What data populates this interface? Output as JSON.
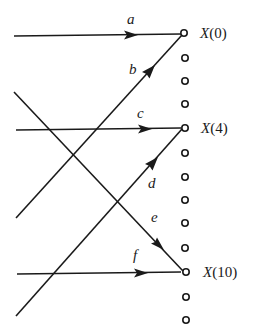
{
  "diagram": {
    "type": "signal-flow-graph",
    "node_count": 13,
    "output_nodes": [
      {
        "index": 0,
        "label": "X(0)",
        "label_var": "X",
        "label_arg": "(0)"
      },
      {
        "index": 4,
        "label": "X(4)",
        "label_var": "X",
        "label_arg": "(4)"
      },
      {
        "index": 10,
        "label": "X(10)",
        "label_var": "X",
        "label_arg": "(10)"
      }
    ],
    "edges": [
      {
        "label": "a",
        "to": "X(0)",
        "direction": "horizontal"
      },
      {
        "label": "b",
        "to": "X(0)",
        "direction": "diagonal-up"
      },
      {
        "label": "c",
        "to": "X(4)",
        "direction": "horizontal"
      },
      {
        "label": "d",
        "to": "X(4)",
        "direction": "diagonal-up"
      },
      {
        "label": "e",
        "to": "X(10)",
        "direction": "diagonal-down"
      },
      {
        "label": "f",
        "to": "X(10)",
        "direction": "horizontal"
      }
    ],
    "colors": {
      "stroke": "#1a1a1a",
      "background": "#ffffff"
    }
  }
}
